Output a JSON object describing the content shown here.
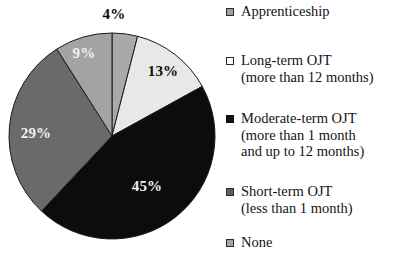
{
  "chart_data": {
    "type": "pie",
    "title": "",
    "subtitle": "",
    "xlabel": "",
    "ylabel": "",
    "grid": false,
    "legend_position": "right",
    "start_angle_deg": 0,
    "direction": "clockwise",
    "categories": [
      "Apprenticeship",
      "Long-term OJT (more than 12 months)",
      "Moderate-term OJT (more than 1 month and up to 12 months)",
      "Short-term OJT (less than 1 month)",
      "None"
    ],
    "values": [
      4,
      13,
      45,
      29,
      9
    ],
    "data_labels": [
      "4%",
      "13%",
      "45%",
      "29%",
      "9%"
    ],
    "slice_colors": [
      "#a9a9a9",
      "#e8e8e6",
      "#0c0c0c",
      "#6a6a6a",
      "#a3a3a3"
    ],
    "slice_stroke": "#1a1a1a",
    "total": 100,
    "units": "percent"
  },
  "pie": {
    "center_x": 112,
    "center_y": 136,
    "radius": 103,
    "slices": [
      {
        "name": "apprenticeship",
        "label": "4%",
        "value": 4,
        "fill": "#a9a9a9",
        "label_x": 114,
        "label_y": 16,
        "label_tone": "dark"
      },
      {
        "name": "long-term-ojt",
        "label": "13%",
        "value": 13,
        "fill": "#e8e8e6",
        "label_x": 163,
        "label_y": 73,
        "label_tone": "dark"
      },
      {
        "name": "moderate-term-ojt",
        "label": "45%",
        "value": 45,
        "fill": "#0c0c0c",
        "label_x": 147,
        "label_y": 188,
        "label_tone": "light"
      },
      {
        "name": "short-term-ojt",
        "label": "29%",
        "value": 29,
        "fill": "#6a6a6a",
        "label_x": 36,
        "label_y": 135,
        "label_tone": "light"
      },
      {
        "name": "none",
        "label": "9%",
        "value": 9,
        "fill": "#a3a3a3",
        "label_x": 84,
        "label_y": 55,
        "label_tone": "light"
      }
    ]
  },
  "legend": {
    "items": [
      {
        "key": "apprenticeship",
        "label": "Apprenticeship",
        "detail": "",
        "swatch_fill": "#9f9f9f",
        "swatch_border": "#2a2a2a",
        "top": 3
      },
      {
        "key": "long-term-ojt",
        "label": "Long-term OJT",
        "detail": "(more than 12 months)",
        "swatch_fill": "#fcfcfc",
        "swatch_border": "#2a2a2a",
        "top": 52
      },
      {
        "key": "moderate-term-ojt",
        "label": "Moderate-term OJT",
        "detail": "(more than 1 month\nand up to 12 months)",
        "swatch_fill": "#121212",
        "swatch_border": "#121212",
        "top": 110
      },
      {
        "key": "short-term-ojt",
        "label": "Short-term OJT",
        "detail": "(less than 1 month)",
        "swatch_fill": "#5e5e5e",
        "swatch_border": "#2a2a2a",
        "top": 183
      },
      {
        "key": "none",
        "label": "None",
        "detail": "",
        "swatch_fill": "#a5a5a5",
        "swatch_border": "#2a2a2a",
        "top": 234
      }
    ]
  }
}
